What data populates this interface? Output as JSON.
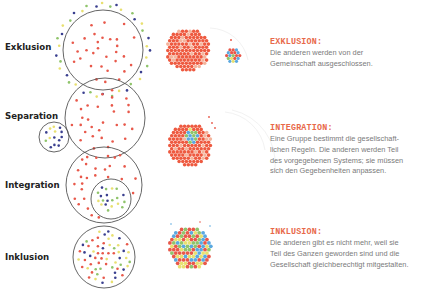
{
  "colors": {
    "accent_title": "#e8694a",
    "circle_stroke": "#555555",
    "label_text": "#222222",
    "body_text": "#7a7a7a",
    "dot_red": "#e8584a",
    "dot_navy": "#3a3f8f",
    "dot_green": "#8fc46b",
    "dot_yellow": "#e8e070",
    "dot_blue": "#5aa8e0",
    "cluster_red": "#ee5a40",
    "cluster_light": "#f4b49c"
  },
  "rows": [
    {
      "label": "Exklusion",
      "title": "EXKLUSION:",
      "lines": [
        "Die anderen werden von der",
        "Gemeinschaft ausgeschlossen."
      ]
    },
    {
      "label": "Separation"
    },
    {
      "label": "Integration",
      "title": "INTEGRATION:",
      "lines": [
        "Eine Gruppe bestimmt die gesellschaft-",
        "lichen Regeln. Die anderen werden Teil",
        "des vorgegebenen Systems; sie müssen",
        "sich den Gegebenheiten anpassen."
      ]
    },
    {
      "label": "Inklusion",
      "title": "INKLUSION:",
      "lines": [
        "Die anderen gibt es nicht mehr, weil sie",
        "Teil des Ganzen geworden sind und die",
        "Gesellschaft gleichberechtigt mitgestalten."
      ]
    }
  ]
}
